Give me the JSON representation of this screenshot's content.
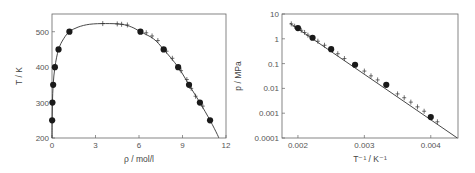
{
  "chart_data": [
    {
      "type": "scatter",
      "title": "",
      "xlabel": "ρ / mol/l",
      "ylabel": "T / K",
      "xlim": [
        0,
        12
      ],
      "ylim": [
        200,
        550
      ],
      "x_ticks": [
        "0",
        "3",
        "6",
        "9",
        "12"
      ],
      "y_ticks": [
        "200",
        "300",
        "400",
        "500"
      ],
      "grid": false,
      "series": [
        {
          "name": "experimental (circles)",
          "marker": "circle",
          "points": [
            [
              0.01,
              250
            ],
            [
              0.03,
              300
            ],
            [
              0.08,
              350
            ],
            [
              0.2,
              400
            ],
            [
              0.45,
              450
            ],
            [
              1.2,
              500
            ],
            [
              6.1,
              500
            ],
            [
              7.7,
              450
            ],
            [
              8.7,
              400
            ],
            [
              9.45,
              350
            ],
            [
              10.2,
              300
            ],
            [
              10.9,
              250
            ]
          ]
        },
        {
          "name": "simulation (crosses)",
          "marker": "plus",
          "points": [
            [
              3.5,
              523
            ],
            [
              4.5,
              522
            ],
            [
              4.8,
              521
            ],
            [
              5.2,
              519
            ],
            [
              6.5,
              497
            ],
            [
              6.9,
              488
            ],
            [
              7.3,
              475
            ],
            [
              7.9,
              445
            ],
            [
              8.3,
              425
            ],
            [
              8.9,
              390
            ],
            [
              9.3,
              365
            ],
            [
              9.6,
              340
            ],
            [
              9.9,
              318
            ],
            [
              10.4,
              290
            ]
          ]
        },
        {
          "name": "correlation (line)",
          "marker": "none",
          "points": [
            [
              0.0,
              200
            ],
            [
              0.01,
              250
            ],
            [
              0.03,
              300
            ],
            [
              0.08,
              350
            ],
            [
              0.2,
              400
            ],
            [
              0.45,
              450
            ],
            [
              0.8,
              480
            ],
            [
              1.2,
              500
            ],
            [
              1.8,
              513
            ],
            [
              2.6,
              521
            ],
            [
              3.7,
              523
            ],
            [
              4.8,
              521
            ],
            [
              5.5,
              513
            ],
            [
              6.1,
              500
            ],
            [
              7.0,
              480
            ],
            [
              7.7,
              450
            ],
            [
              8.7,
              400
            ],
            [
              9.45,
              350
            ],
            [
              10.2,
              300
            ],
            [
              10.9,
              250
            ],
            [
              11.4,
              210
            ],
            [
              11.5,
              200
            ]
          ]
        }
      ]
    },
    {
      "type": "scatter",
      "title": "",
      "xlabel": "T⁻¹ / K⁻¹",
      "ylabel": "p / MPa",
      "xlim": [
        0.00176,
        0.00441
      ],
      "ylim": [
        0.0001,
        10
      ],
      "yscale": "log",
      "x_ticks": [
        "0.002",
        "0.003",
        "0.004"
      ],
      "y_ticks": [
        "10",
        "1",
        "0.1",
        "0.01",
        "0.001",
        "0.0001"
      ],
      "grid": false,
      "series": [
        {
          "name": "experimental (circles)",
          "marker": "circle",
          "points": [
            [
              0.002,
              2.7
            ],
            [
              0.00222,
              1.1
            ],
            [
              0.0025,
              0.38
            ],
            [
              0.00286,
              0.09
            ],
            [
              0.00333,
              0.014
            ],
            [
              0.004,
              0.0007
            ]
          ]
        },
        {
          "name": "simulation (crosses)",
          "marker": "plus",
          "points": [
            [
              0.0019,
              4.0
            ],
            [
              0.00195,
              3.2
            ],
            [
              0.00205,
              2.2
            ],
            [
              0.0021,
              1.8
            ],
            [
              0.00215,
              1.4
            ],
            [
              0.0023,
              0.8
            ],
            [
              0.0024,
              0.55
            ],
            [
              0.0026,
              0.25
            ],
            [
              0.0027,
              0.16
            ],
            [
              0.003,
              0.05
            ],
            [
              0.0031,
              0.032
            ],
            [
              0.0032,
              0.022
            ],
            [
              0.0035,
              0.006
            ],
            [
              0.0036,
              0.0042
            ],
            [
              0.0037,
              0.0028
            ],
            [
              0.0038,
              0.0018
            ],
            [
              0.0039,
              0.0012
            ],
            [
              0.0041,
              0.00045
            ]
          ]
        },
        {
          "name": "correlation (line)",
          "marker": "none",
          "points": [
            [
              0.00188,
              4.2
            ],
            [
              0.0044,
              0.0001
            ]
          ]
        }
      ]
    }
  ]
}
